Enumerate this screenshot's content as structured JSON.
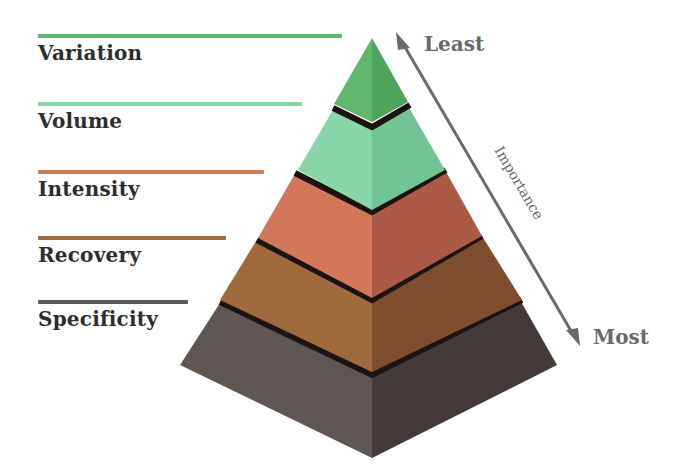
{
  "diagram": {
    "type": "pyramid",
    "levels": [
      {
        "label": "Variation",
        "color": "#5cb46a",
        "line_color": "#5db86a",
        "line_width": 304,
        "top": 34
      },
      {
        "label": "Volume",
        "color": "#7fd0a3",
        "line_color": "#88d4a8",
        "line_width": 264,
        "top": 102
      },
      {
        "label": "Intensity",
        "color": "#d27255",
        "line_color": "#d07a5c",
        "line_width": 226,
        "top": 170
      },
      {
        "label": "Recovery",
        "color": "#9a6336",
        "line_color": "#9c6a42",
        "line_width": 188,
        "top": 236
      },
      {
        "label": "Specificity",
        "color": "#57514d",
        "line_color": "#5e5a58",
        "line_width": 150,
        "top": 300
      }
    ],
    "axis": {
      "title": "Importance",
      "top_label": "Least",
      "bottom_label": "Most",
      "arrow_color": "#6a6a6a"
    }
  }
}
